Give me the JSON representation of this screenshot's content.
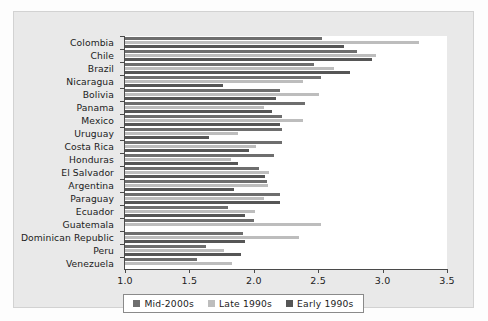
{
  "chart_data": {
    "type": "bar",
    "orientation": "horizontal",
    "title": "",
    "xlabel": "",
    "ylabel": "",
    "xlim": [
      1.0,
      3.5
    ],
    "xticks": [
      "1.0",
      "1.5",
      "2.0",
      "2.5",
      "3.0",
      "3.5"
    ],
    "grid": false,
    "legend_position": "bottom-center",
    "categories": [
      "Colombia",
      "Chile",
      "Brazil",
      "Nicaragua",
      "Bolivia",
      "Panama",
      "Mexico",
      "Uruguay",
      "Costa Rica",
      "Honduras",
      "El Salvador",
      "Argentina",
      "Paraguay",
      "Ecuador",
      "Guatemala",
      "Dominican Republic",
      "Peru",
      "Venezuela"
    ],
    "series": [
      {
        "name": "Mid-2000s",
        "color": "#6e6e6e",
        "values": [
          2.53,
          2.8,
          2.47,
          2.52,
          2.2,
          2.4,
          2.22,
          2.22,
          2.22,
          2.16,
          2.04,
          2.1,
          2.2,
          1.8,
          2.0,
          1.92,
          1.63,
          1.56
        ]
      },
      {
        "name": "Late 1990s",
        "color": "#bdbdbd",
        "values": [
          3.28,
          2.95,
          2.62,
          2.38,
          2.51,
          2.08,
          2.38,
          1.88,
          2.02,
          1.82,
          2.12,
          2.11,
          2.08,
          2.01,
          2.52,
          2.35,
          1.77,
          1.83
        ]
      },
      {
        "name": "Early 1990s",
        "color": "#565656",
        "values": [
          2.7,
          2.92,
          2.75,
          1.76,
          2.17,
          2.14,
          2.2,
          1.65,
          1.96,
          1.88,
          2.09,
          1.85,
          2.2,
          1.93,
          null,
          1.93,
          1.9,
          null
        ]
      }
    ]
  },
  "legend": {
    "items": [
      {
        "label": "Mid-2000s",
        "color": "#6e6e6e"
      },
      {
        "label": "Late 1990s",
        "color": "#bdbdbd"
      },
      {
        "label": "Early 1990s",
        "color": "#565656"
      }
    ]
  }
}
